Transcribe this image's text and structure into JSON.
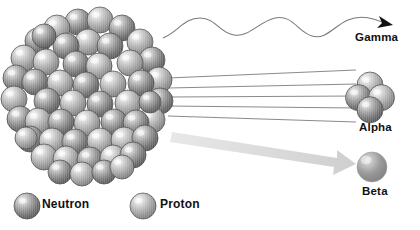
{
  "diagram": {
    "background_color": "#ffffff"
  },
  "nucleus": {
    "name": "atomic-nucleus",
    "center_x": 80,
    "center_y": 95,
    "radius": 78,
    "particle_count": 53,
    "particle_radius": 13,
    "neutron_color": "#6f6f6f",
    "proton_color": "#9a9a9a",
    "outline_color": "#4a4a4a",
    "particles": [
      {
        "x": 78,
        "y": 22,
        "r": 13,
        "type": "neutron"
      },
      {
        "x": 100,
        "y": 20,
        "r": 13,
        "type": "proton"
      },
      {
        "x": 57,
        "y": 28,
        "r": 13,
        "type": "proton"
      },
      {
        "x": 122,
        "y": 28,
        "r": 13,
        "type": "neutron"
      },
      {
        "x": 38,
        "y": 41,
        "r": 13,
        "type": "neutron"
      },
      {
        "x": 140,
        "y": 42,
        "r": 13,
        "type": "proton"
      },
      {
        "x": 88,
        "y": 42,
        "r": 13,
        "type": "proton"
      },
      {
        "x": 66,
        "y": 46,
        "r": 13,
        "type": "neutron"
      },
      {
        "x": 110,
        "y": 46,
        "r": 13,
        "type": "neutron"
      },
      {
        "x": 24,
        "y": 58,
        "r": 13,
        "type": "proton"
      },
      {
        "x": 152,
        "y": 60,
        "r": 13,
        "type": "neutron"
      },
      {
        "x": 46,
        "y": 62,
        "r": 13,
        "type": "proton"
      },
      {
        "x": 130,
        "y": 63,
        "r": 13,
        "type": "proton"
      },
      {
        "x": 76,
        "y": 64,
        "r": 13,
        "type": "neutron"
      },
      {
        "x": 99,
        "y": 66,
        "r": 13,
        "type": "proton"
      },
      {
        "x": 16,
        "y": 78,
        "r": 13,
        "type": "neutron"
      },
      {
        "x": 159,
        "y": 80,
        "r": 13,
        "type": "proton"
      },
      {
        "x": 35,
        "y": 82,
        "r": 13,
        "type": "neutron"
      },
      {
        "x": 141,
        "y": 83,
        "r": 13,
        "type": "neutron"
      },
      {
        "x": 60,
        "y": 83,
        "r": 13,
        "type": "proton"
      },
      {
        "x": 86,
        "y": 85,
        "r": 13,
        "type": "neutron"
      },
      {
        "x": 113,
        "y": 84,
        "r": 13,
        "type": "proton"
      },
      {
        "x": 14,
        "y": 99,
        "r": 13,
        "type": "proton"
      },
      {
        "x": 160,
        "y": 101,
        "r": 13,
        "type": "neutron"
      },
      {
        "x": 47,
        "y": 101,
        "r": 13,
        "type": "neutron"
      },
      {
        "x": 73,
        "y": 103,
        "r": 13,
        "type": "proton"
      },
      {
        "x": 100,
        "y": 104,
        "r": 13,
        "type": "neutron"
      },
      {
        "x": 128,
        "y": 103,
        "r": 13,
        "type": "proton"
      },
      {
        "x": 20,
        "y": 119,
        "r": 13,
        "type": "neutron"
      },
      {
        "x": 152,
        "y": 120,
        "r": 13,
        "type": "proton"
      },
      {
        "x": 38,
        "y": 121,
        "r": 13,
        "type": "proton"
      },
      {
        "x": 61,
        "y": 122,
        "r": 13,
        "type": "neutron"
      },
      {
        "x": 87,
        "y": 123,
        "r": 13,
        "type": "proton"
      },
      {
        "x": 114,
        "y": 122,
        "r": 13,
        "type": "neutron"
      },
      {
        "x": 136,
        "y": 123,
        "r": 13,
        "type": "neutron"
      },
      {
        "x": 30,
        "y": 139,
        "r": 13,
        "type": "neutron"
      },
      {
        "x": 52,
        "y": 141,
        "r": 13,
        "type": "proton"
      },
      {
        "x": 75,
        "y": 142,
        "r": 13,
        "type": "neutron"
      },
      {
        "x": 100,
        "y": 141,
        "r": 13,
        "type": "proton"
      },
      {
        "x": 124,
        "y": 140,
        "r": 13,
        "type": "proton"
      },
      {
        "x": 145,
        "y": 138,
        "r": 13,
        "type": "neutron"
      },
      {
        "x": 44,
        "y": 157,
        "r": 13,
        "type": "proton"
      },
      {
        "x": 66,
        "y": 159,
        "r": 13,
        "type": "proton"
      },
      {
        "x": 90,
        "y": 160,
        "r": 13,
        "type": "neutron"
      },
      {
        "x": 113,
        "y": 158,
        "r": 13,
        "type": "proton"
      },
      {
        "x": 133,
        "y": 155,
        "r": 13,
        "type": "neutron"
      },
      {
        "x": 60,
        "y": 172,
        "r": 12,
        "type": "neutron"
      },
      {
        "x": 82,
        "y": 174,
        "r": 12,
        "type": "proton"
      },
      {
        "x": 104,
        "y": 172,
        "r": 12,
        "type": "neutron"
      },
      {
        "x": 122,
        "y": 167,
        "r": 12,
        "type": "proton"
      },
      {
        "x": 44,
        "y": 36,
        "r": 12,
        "type": "neutron"
      },
      {
        "x": 26,
        "y": 138,
        "r": 11,
        "type": "proton"
      },
      {
        "x": 150,
        "y": 102,
        "r": 11,
        "type": "neutron"
      }
    ]
  },
  "emissions": [
    {
      "id": "gamma",
      "label": "Gamma",
      "ray_type": "wave",
      "stroke_color": "#7a7a7a",
      "arrow_color": "#111111",
      "label_color": "#111111"
    },
    {
      "id": "alpha",
      "label": "Alpha",
      "ray_type": "lines",
      "line_count": 5,
      "stroke_color": "#7d7d7d",
      "label_color": "#111111",
      "particle": {
        "name": "alpha-particle",
        "nucleon_count": 4,
        "center_x": 370,
        "center_y": 97,
        "nucleon_radius": 13
      }
    },
    {
      "id": "beta",
      "label": "Beta",
      "ray_type": "thick-arrow",
      "arrow_color": "#d6d6d6",
      "label_color": "#111111",
      "particle": {
        "name": "beta-particle",
        "center_x": 372,
        "center_y": 167,
        "radius": 15,
        "color": "#8c8c8c"
      }
    }
  ],
  "legend": {
    "name": "particle-legend",
    "items": [
      {
        "label": "Neutron",
        "swatch_color": "#6f6f6f",
        "cx": 27,
        "cy": 206,
        "r": 13
      },
      {
        "label": "Proton",
        "swatch_color": "#9a9a9a",
        "cx": 143,
        "cy": 206,
        "r": 13
      }
    ]
  }
}
